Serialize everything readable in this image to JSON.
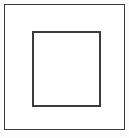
{
  "figure": {
    "type": "nested-squares-diagram",
    "canvas": {
      "width_px": 129,
      "height_px": 138,
      "background_color": "#fdfdfd"
    },
    "shapes": [
      {
        "name": "outer-rectangle",
        "shape": "rectangle",
        "x_px": 4,
        "y_px": 4,
        "width_px": 121,
        "height_px": 126,
        "stroke_color": "#3b3b3b",
        "stroke_width_px": 1.5,
        "fill_color": "#ffffff",
        "label": ""
      },
      {
        "name": "inner-rectangle",
        "shape": "rectangle",
        "x_px": 31,
        "y_px": 30,
        "width_px": 69,
        "height_px": 76,
        "stroke_color": "#3b3b3b",
        "stroke_width_px": 2,
        "fill_color": "#ffffff",
        "label": ""
      }
    ]
  }
}
